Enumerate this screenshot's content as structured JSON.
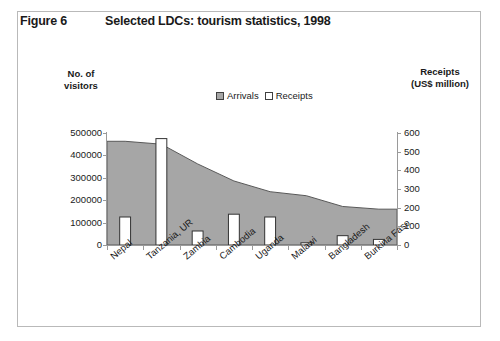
{
  "figure": {
    "number": "Figure 6",
    "title": "Selected LDCs: tourism statistics, 1998"
  },
  "left_axis_title": "No. of\nvisitors",
  "left_axis_title_line1": "No. of",
  "left_axis_title_line2": "visitors",
  "right_axis_title_line1": "Receipts",
  "right_axis_title_line2": "(US$ million)",
  "legend": {
    "arrivals_label": "Arrivals",
    "receipts_label": "Receipts"
  },
  "colors": {
    "arrivals_fill": "#a6a6a6",
    "arrivals_stroke": "#595959",
    "receipts_fill": "#ffffff",
    "receipts_stroke": "#333333",
    "axis": "#9a9a9a",
    "frame": "#b9b9b9",
    "text": "#1a1a1a"
  },
  "chart_data": {
    "type": "area",
    "title": "Selected LDCs: tourism statistics, 1998",
    "subtitle": "",
    "xlabel": "",
    "ylabel": "No. of visitors",
    "y2label": "Receipts (US$ million)",
    "categories": [
      "Nepal",
      "Tanzania, UR",
      "Zambia",
      "Cambodia",
      "Uganda",
      "Malawi",
      "Bangladesh",
      "Burkina Faso"
    ],
    "series": [
      {
        "name": "Arrivals",
        "type": "area",
        "axis": "left",
        "unit": "visitors",
        "values": [
          463000,
          450000,
          362000,
          286000,
          238000,
          220000,
          172000,
          160000
        ]
      },
      {
        "name": "Receipts",
        "type": "bar",
        "axis": "right",
        "unit": "US$ million",
        "values": [
          150,
          570,
          75,
          165,
          150,
          12,
          50,
          30
        ]
      }
    ],
    "ylim": [
      0,
      500000
    ],
    "y2lim": [
      0,
      600
    ],
    "yticks": [
      0,
      100000,
      200000,
      300000,
      400000,
      500000
    ],
    "yticklabels": [
      "0",
      "100000",
      "200000",
      "300000",
      "400000",
      "500000"
    ],
    "y2ticks": [
      0,
      100,
      200,
      300,
      400,
      500,
      600
    ],
    "y2ticklabels": [
      "0",
      "100",
      "200",
      "300",
      "400",
      "500",
      "600"
    ],
    "grid": false,
    "legend_position": "top-center"
  }
}
